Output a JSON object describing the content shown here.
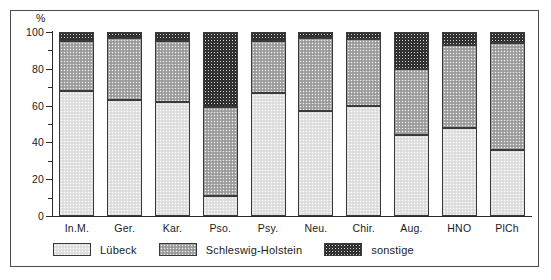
{
  "chart_data": {
    "type": "bar",
    "subtype": "stacked-100-percent",
    "title": "",
    "xlabel": "",
    "ylabel": "%",
    "ylim": [
      0,
      100
    ],
    "yticks": [
      0,
      10,
      20,
      30,
      40,
      50,
      60,
      70,
      80,
      90,
      100
    ],
    "ytick_labels": [
      "0",
      "",
      "20",
      "",
      "40",
      "",
      "60",
      "",
      "80",
      "",
      "100"
    ],
    "grid": false,
    "legend_position": "bottom-left",
    "categories": [
      "In.M.",
      "Ger.",
      "Kar.",
      "Pso.",
      "Psy.",
      "Neu.",
      "Chir.",
      "Aug.",
      "HNO",
      "PlCh"
    ],
    "series": [
      {
        "name": "Lübeck",
        "color": "#e2e2e2",
        "values": [
          68,
          63,
          62,
          11,
          67,
          57,
          60,
          44,
          48,
          36
        ]
      },
      {
        "name": "Schleswig-Holstein",
        "color": "#a8a8a8",
        "values": [
          27,
          34,
          33,
          48,
          28,
          40,
          36,
          36,
          45,
          58
        ]
      },
      {
        "name": "sonstige",
        "color": "#2a2a2a",
        "values": [
          5,
          3,
          5,
          41,
          5,
          3,
          4,
          20,
          7,
          6
        ]
      }
    ]
  },
  "axis": {
    "unit_label": "%",
    "ytick_labels": [
      "100",
      "80",
      "60",
      "40",
      "20",
      "0"
    ],
    "ytick_values": [
      100,
      80,
      60,
      40,
      20,
      0
    ]
  },
  "legend": {
    "items": [
      {
        "label": "Lübeck",
        "pattern": "pat-luebeck"
      },
      {
        "label": "Schleswig-Holstein",
        "pattern": "pat-sh"
      },
      {
        "label": "sonstige",
        "pattern": "pat-sonstige"
      }
    ]
  }
}
